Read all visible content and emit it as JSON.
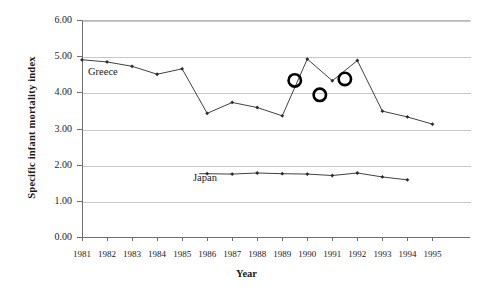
{
  "chart_data": {
    "type": "line",
    "title": "",
    "xlabel": "Year",
    "ylabel": "Specific infant  mortality index",
    "x": [
      1981,
      1982,
      1983,
      1984,
      1985,
      1986,
      1987,
      1988,
      1989,
      1990,
      1991,
      1992,
      1993,
      1994,
      1995
    ],
    "categories": [
      "1981",
      "1982",
      "1983",
      "1984",
      "1985",
      "1986",
      "1987",
      "1988",
      "1989",
      "1990",
      "1991",
      "1992",
      "1993",
      "1994",
      "1995"
    ],
    "ylim": [
      0.0,
      6.0
    ],
    "ytick_labels": [
      "0.00",
      "1.00",
      "2.00",
      "3.00",
      "4.00",
      "5.00",
      "6.00"
    ],
    "ytick_values": [
      0.0,
      1.0,
      2.0,
      3.0,
      4.0,
      5.0,
      6.0
    ],
    "grid": true,
    "grid_axis": "y",
    "legend_position": "inline-labels",
    "series": [
      {
        "name": "Greece",
        "label": "Greece",
        "color": "#2b2b2b",
        "marker": "diamond",
        "x": [
          1981,
          1982,
          1983,
          1984,
          1985,
          1986,
          1987,
          1988,
          1989,
          1990,
          1991,
          1992,
          1993,
          1994,
          1995
        ],
        "values": [
          4.9,
          4.84,
          4.72,
          4.5,
          4.65,
          3.42,
          3.72,
          3.58,
          3.35,
          4.92,
          4.32,
          4.88,
          3.48,
          3.32,
          3.12
        ]
      },
      {
        "name": "Japan",
        "label": "Japan",
        "color": "#2b2b2b",
        "marker": "diamond",
        "x": [
          1986,
          1987,
          1988,
          1989,
          1990,
          1991,
          1992,
          1993,
          1994
        ],
        "values": [
          1.75,
          1.74,
          1.77,
          1.75,
          1.74,
          1.7,
          1.77,
          1.66,
          1.58
        ]
      }
    ],
    "annotations": [
      {
        "type": "circle",
        "label": "circle-annotation-1",
        "x": 1989.5,
        "y": 4.33
      },
      {
        "type": "circle",
        "label": "circle-annotation-2",
        "x": 1990.5,
        "y": 3.93
      },
      {
        "type": "circle",
        "label": "circle-annotation-3",
        "x": 1991.5,
        "y": 4.37
      }
    ]
  }
}
